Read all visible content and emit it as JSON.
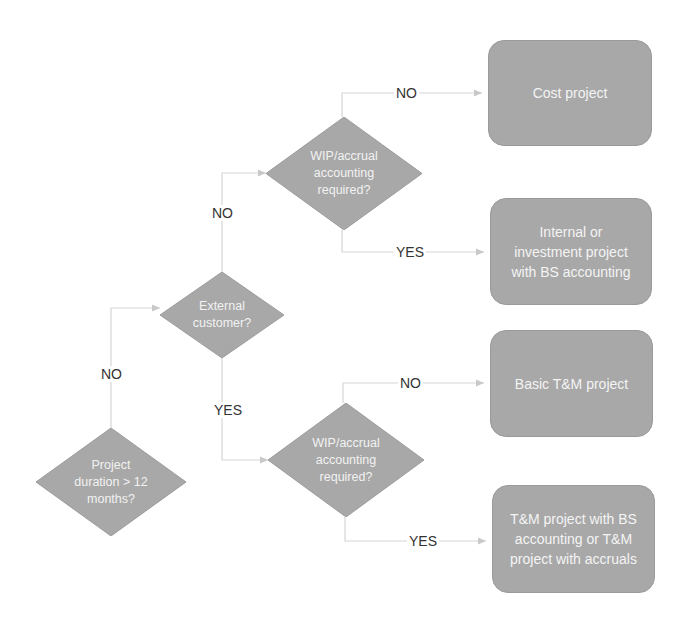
{
  "diagram": {
    "type": "decision-flowchart",
    "colors": {
      "shape_fill": "#a8a8a8",
      "shape_text": "#f2f2f2",
      "connector": "#d0d0d0",
      "label_text": "#333333",
      "background": "#ffffff"
    },
    "decisions": [
      {
        "id": "d1",
        "text": "Project\nduration > 12\nmonths?"
      },
      {
        "id": "d2",
        "text": "External\ncustomer?"
      },
      {
        "id": "d3",
        "text": "WIP/accrual\naccounting\nrequired?"
      },
      {
        "id": "d4",
        "text": "WIP/accrual\naccounting\nrequired?"
      }
    ],
    "outcomes": [
      {
        "id": "o1",
        "text": "Cost project"
      },
      {
        "id": "o2",
        "text": "Internal or\ninvestment project\nwith BS accounting"
      },
      {
        "id": "o3",
        "text": "Basic T&M project"
      },
      {
        "id": "o4",
        "text": "T&M project with BS\naccounting or T&M\nproject with accruals"
      }
    ],
    "edge_labels": {
      "d1_no": "NO",
      "d2_no": "NO",
      "d2_yes": "YES",
      "d3_no": "NO",
      "d3_yes": "YES",
      "d4_no": "NO",
      "d4_yes": "YES"
    },
    "edges": [
      {
        "from": "d1",
        "to": "d2",
        "label": "NO"
      },
      {
        "from": "d2",
        "to": "d3",
        "label": "NO"
      },
      {
        "from": "d2",
        "to": "d4",
        "label": "YES"
      },
      {
        "from": "d3",
        "to": "o1",
        "label": "NO"
      },
      {
        "from": "d3",
        "to": "o2",
        "label": "YES"
      },
      {
        "from": "d4",
        "to": "o3",
        "label": "NO"
      },
      {
        "from": "d4",
        "to": "o4",
        "label": "YES"
      }
    ]
  }
}
